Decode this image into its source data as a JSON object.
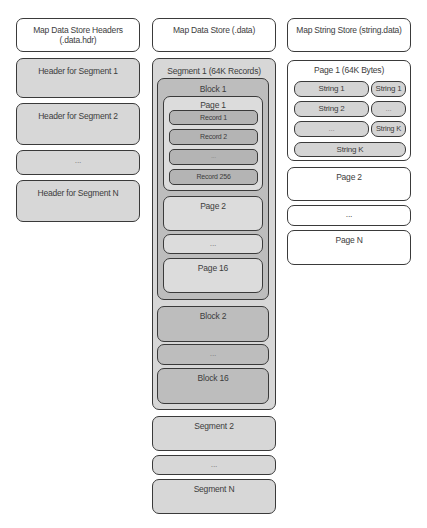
{
  "left_column": {
    "title": "Map Data Store Headers (.data.hdr)",
    "items": [
      {
        "label": "Header for Segment 1"
      },
      {
        "label": "Header for Segment 2"
      },
      {
        "label": "..."
      },
      {
        "label": "Header for Segment N"
      }
    ]
  },
  "middle_column": {
    "title": "Map Data Store (.data)",
    "segment1": {
      "label": "Segment 1 (64K Records)",
      "block1": {
        "label": "Block 1",
        "page1": {
          "label": "Page 1",
          "records": [
            {
              "label": "Record 1"
            },
            {
              "label": "Record 2"
            },
            {
              "label": "..."
            },
            {
              "label": "Record 256"
            }
          ]
        },
        "pages": [
          {
            "label": "Page 2"
          },
          {
            "label": "..."
          },
          {
            "label": "Page 16"
          }
        ]
      },
      "blocks": [
        {
          "label": "Block 2"
        },
        {
          "label": "..."
        },
        {
          "label": "Block 16"
        }
      ]
    },
    "segments": [
      {
        "label": "Segment 2"
      },
      {
        "label": "..."
      },
      {
        "label": "Segment N"
      }
    ]
  },
  "right_column": {
    "title": "Map String Store (string.data)",
    "page1": {
      "label": "Page 1 (64K Bytes)",
      "rows": [
        {
          "left": "String 1",
          "right": "String 1"
        },
        {
          "left": "String 2",
          "right": "..."
        },
        {
          "left": "...",
          "right": "String K"
        }
      ],
      "last": "String K"
    },
    "pages": [
      {
        "label": "Page 2"
      },
      {
        "label": "..."
      },
      {
        "label": "Page N"
      }
    ]
  }
}
